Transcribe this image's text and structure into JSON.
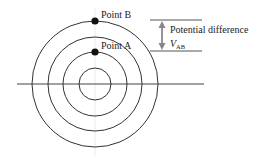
{
  "diagram": {
    "points": [
      {
        "id": "B",
        "label": "Point B",
        "circle_index": 3
      },
      {
        "id": "A",
        "label": "Point A",
        "circle_index": 1
      }
    ],
    "circle_count": 4,
    "annotation": {
      "label": "Potential difference",
      "symbol": "V",
      "subscript": "AB"
    },
    "colors": {
      "line": "#333333",
      "point": "#111111",
      "arrow": "#888888",
      "text": "#222222"
    }
  }
}
